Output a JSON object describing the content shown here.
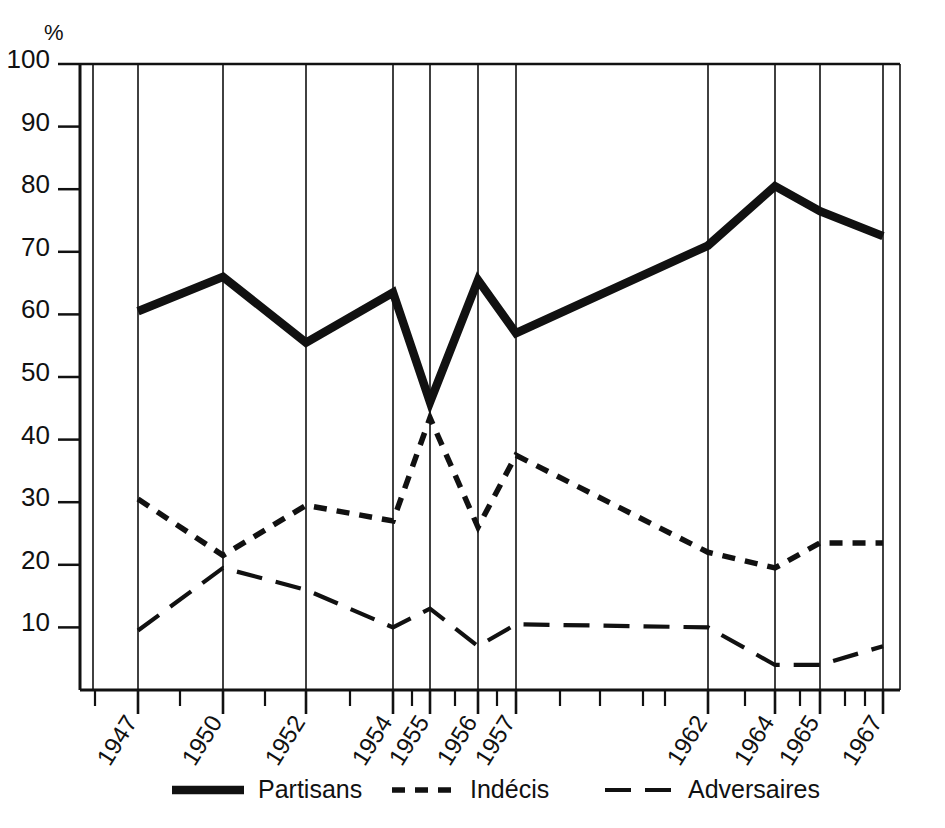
{
  "chart_data": {
    "type": "line",
    "title": "",
    "xlabel": "",
    "ylabel": "%",
    "ylim": [
      0,
      100
    ],
    "grid": "vertical gridlines at each data year",
    "legend_position": "bottom-center",
    "y_ticks": [
      100,
      90,
      80,
      70,
      60,
      50,
      40,
      30,
      20,
      10
    ],
    "x_tick_labels": [
      "1947",
      "1950",
      "1952",
      "1954",
      "1955",
      "1956",
      "1957",
      "1962",
      "1964",
      "1965",
      "1967"
    ],
    "categories": [
      "1947",
      "1950",
      "1952",
      "1954",
      "1955",
      "1956",
      "1957",
      "1962",
      "1964",
      "1965",
      "1967"
    ],
    "series": [
      {
        "name": "Partisans",
        "style": "solid-thick",
        "values": [
          60.5,
          66,
          55.5,
          63.5,
          46,
          65.5,
          57,
          71,
          80.5,
          76.5,
          72.5
        ]
      },
      {
        "name": "Indécis",
        "style": "short-dash",
        "values": [
          30.5,
          21.5,
          29.5,
          27,
          43.5,
          26,
          37.5,
          22,
          19.5,
          23.5,
          23.5
        ]
      },
      {
        "name": "Adversaires",
        "style": "long-dash",
        "values": [
          9.5,
          19.5,
          16,
          10,
          13,
          7,
          10.5,
          10,
          4,
          4,
          7
        ]
      }
    ]
  },
  "axis": {
    "percent_symbol": "%",
    "y_labels": [
      "100",
      "90",
      "80",
      "70",
      "60",
      "50",
      "40",
      "30",
      "20",
      "10"
    ]
  },
  "legend": {
    "items": [
      {
        "label": "Partisans",
        "swatch": "solid-line-swatch"
      },
      {
        "label": "Indécis",
        "swatch": "short-dash-line-swatch"
      },
      {
        "label": "Adversaires",
        "swatch": "long-dash-line-swatch"
      }
    ]
  },
  "colors": {
    "ink": "#111111",
    "background": "#ffffff"
  }
}
